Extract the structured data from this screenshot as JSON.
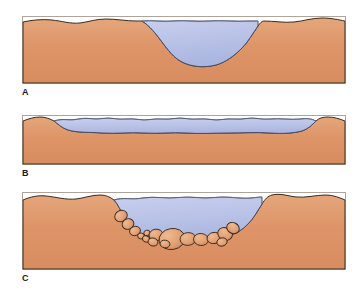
{
  "figure": {
    "type": "geological-cross-section-series",
    "panel_count": 3,
    "background_color": "#ffffff"
  },
  "colors": {
    "ground_fill": "#dd9467",
    "ground_fill_light": "#e3a178",
    "ground_shadow": "#c9805a",
    "water_fill": "#b7c1e6",
    "water_fill_light": "#c6cdec",
    "water_shade": "#a9b4e0",
    "outline": "#2b2b2b",
    "water_outline": "#3a3f55",
    "rock_fill": "#e0a075",
    "rock_outline": "#3a2a1e",
    "label_color": "#1a1a1a"
  },
  "panels": [
    {
      "id": "panel-a",
      "label": "A",
      "caption": "A",
      "description": "Deep V-shaped basin filled with water; flat undulating ground surface on both sides.",
      "water_present": true,
      "rocks_present": false,
      "water_depth": "deep",
      "basin_shape": "steep-sided bowl"
    },
    {
      "id": "panel-b",
      "label": "B",
      "caption": "B",
      "description": "Broad shallow water body with gently undulating surface spanning nearly the full width.",
      "water_present": true,
      "rocks_present": false,
      "water_depth": "shallow",
      "basin_shape": "wide flat trough"
    },
    {
      "id": "panel-c",
      "label": "C",
      "caption": "C",
      "description": "Basin partly infilled with rounded boulders and cobbles along the bottom, water above.",
      "water_present": true,
      "rocks_present": true,
      "rock_count": 16,
      "water_depth": "medium",
      "basin_shape": "bowl with sediment fill"
    }
  ],
  "labels": {
    "a": "A",
    "b": "B",
    "c": "C"
  }
}
